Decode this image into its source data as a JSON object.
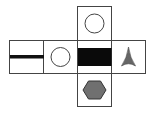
{
  "diagram": {
    "type": "cube-net",
    "faces": [
      {
        "id": "top",
        "symbol": "circle-outline",
        "row": 0,
        "col": 2
      },
      {
        "id": "left",
        "symbol": "horizontal-bar",
        "row": 1,
        "col": 0
      },
      {
        "id": "center-left",
        "symbol": "circle-outline",
        "row": 1,
        "col": 1
      },
      {
        "id": "center",
        "symbol": "black-rectangle",
        "row": 1,
        "col": 2
      },
      {
        "id": "right",
        "symbol": "three-point-star",
        "row": 1,
        "col": 3
      },
      {
        "id": "bottom",
        "symbol": "hexagon",
        "row": 2,
        "col": 2
      }
    ],
    "colors": {
      "border": "#444444",
      "black": "#000000",
      "gray_fill": "#6e6e6e",
      "background": "#ffffff"
    }
  }
}
